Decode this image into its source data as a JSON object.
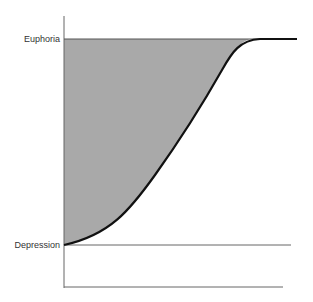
{
  "diagram": {
    "labels": {
      "top": "Euphoria",
      "bottom": "Depression"
    },
    "colors": {
      "fill": "#a9a9a9",
      "curve": "#111111",
      "axis": "#666666"
    }
  }
}
